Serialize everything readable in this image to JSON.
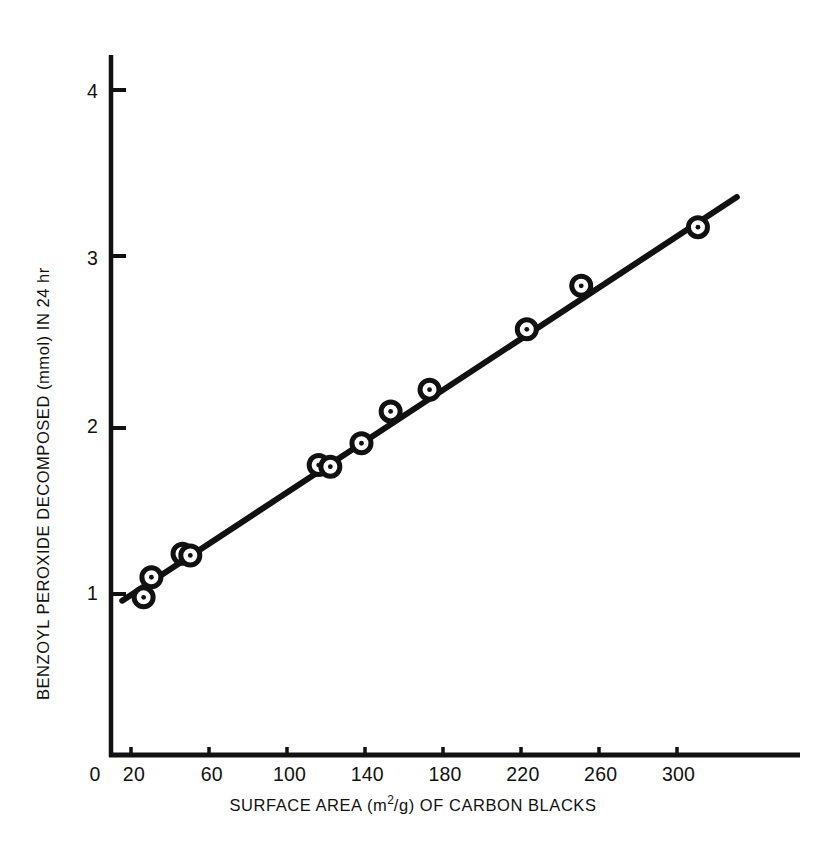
{
  "chart_data": {
    "type": "scatter",
    "title": "",
    "xlabel": "SURFACE AREA (m2/g) OF CARBON BLACKS",
    "xlabel_parts": {
      "prefix": "SURFACE AREA (m",
      "superscript": "2",
      "suffix": "/g) OF CARBON BLACKS"
    },
    "ylabel": "BENZOYL PEROXIDE DECOMPOSED (mmol) IN 24 hr",
    "xlim": [
      0,
      340
    ],
    "ylim": [
      0,
      4.35
    ],
    "grid": false,
    "legend": null,
    "x_tick_labels": [
      "0",
      "20",
      "60",
      "100",
      "140",
      "180",
      "220",
      "260",
      "300"
    ],
    "x_ticks": [
      0,
      20,
      60,
      100,
      140,
      180,
      220,
      260,
      300
    ],
    "y_tick_labels": [
      "1",
      "2",
      "3",
      "4"
    ],
    "y_ticks": [
      1,
      2,
      3,
      4
    ],
    "marker_style": "circle-with-center-dot",
    "series": [
      {
        "name": "Benzoyl peroxide decomposition",
        "marker": "circle-dot",
        "points": [
          {
            "x": 25,
            "y": 0.98
          },
          {
            "x": 29,
            "y": 1.1
          },
          {
            "x": 45,
            "y": 1.24
          },
          {
            "x": 49,
            "y": 1.23
          },
          {
            "x": 115,
            "y": 1.77
          },
          {
            "x": 121,
            "y": 1.76
          },
          {
            "x": 137,
            "y": 1.9
          },
          {
            "x": 152,
            "y": 2.09
          },
          {
            "x": 172,
            "y": 2.22
          },
          {
            "x": 222,
            "y": 2.58
          },
          {
            "x": 250,
            "y": 2.84
          },
          {
            "x": 310,
            "y": 3.19
          }
        ]
      }
    ],
    "fit_line": {
      "name": "linear fit",
      "x_start": 14,
      "y_start": 0.96,
      "x_end": 330,
      "y_end": 3.37
    }
  }
}
